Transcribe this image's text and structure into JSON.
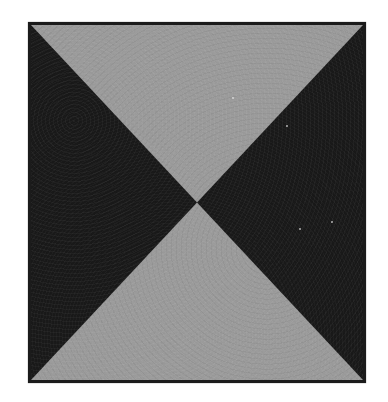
{
  "canvas": {
    "width": 388,
    "height": 402,
    "background_color": "#ffffff",
    "alt_description": "Square grayscale plate with a bowtie X pattern"
  },
  "image_plate": {
    "label": "bowtie-pattern-plate",
    "left": 28,
    "top": 22,
    "width": 338,
    "height": 361,
    "border_color": "#1b1b1b",
    "border_width": 3,
    "field_color": "#9b9b9b"
  },
  "pattern": {
    "type": "bowtie",
    "center_x": 197,
    "center_y": 203,
    "dark_color": "#191919",
    "light_color": "#9b9b9b",
    "wedges": [
      {
        "id": "wedge-left",
        "position": "left",
        "tone": "dark",
        "color": "#191919"
      },
      {
        "id": "wedge-right",
        "position": "right",
        "tone": "dark",
        "color": "#191919"
      },
      {
        "id": "wedge-top",
        "position": "top",
        "tone": "light",
        "color": "#9b9b9b"
      },
      {
        "id": "wedge-bottom",
        "position": "bottom",
        "tone": "light",
        "color": "#9b9b9b"
      }
    ],
    "texture": "film-grain"
  },
  "speckles": [
    {
      "id": "speckle-a"
    },
    {
      "id": "speckle-b"
    },
    {
      "id": "speckle-c"
    },
    {
      "id": "speckle-d"
    }
  ]
}
